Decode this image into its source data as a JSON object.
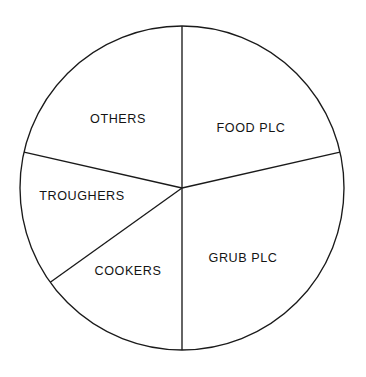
{
  "chart_data": {
    "type": "pie",
    "title": "",
    "subtitle": "",
    "xlabel": "",
    "ylabel": "",
    "legend": "none",
    "grid": false,
    "labels_inside": true,
    "geometry": {
      "center_x": 182,
      "center_y": 188,
      "radius": 162,
      "start_angle_deg": 0,
      "direction": "clockwise"
    },
    "categories": [
      "FOOD PLC",
      "GRUB PLC",
      "COOKERS",
      "TROUGHERS",
      "OTHERS"
    ],
    "values": [
      21.4,
      28.6,
      15.1,
      13.4,
      21.4
    ],
    "angles_deg": [
      77.2,
      102.8,
      54.4,
      48.4,
      77.2
    ],
    "slices": [
      {
        "name": "FOOD PLC",
        "label": "FOOD PLC",
        "value": 21.4,
        "angle_deg": 77.2,
        "start_deg": 0,
        "end_deg": 77.2,
        "label_x": 251,
        "label_y": 129
      },
      {
        "name": "GRUB PLC",
        "label": "GRUB PLC",
        "value": 28.6,
        "angle_deg": 102.8,
        "start_deg": 77.2,
        "end_deg": 180,
        "label_x": 243,
        "label_y": 259
      },
      {
        "name": "COOKERS",
        "label": "COOKERS",
        "value": 15.1,
        "angle_deg": 54.4,
        "start_deg": 180,
        "end_deg": 234.4,
        "label_x": 128,
        "label_y": 272
      },
      {
        "name": "TROUGHERS",
        "label": "TROUGHERS",
        "value": 13.4,
        "angle_deg": 48.4,
        "start_deg": 234.4,
        "end_deg": 282.8,
        "label_x": 82,
        "label_y": 197
      },
      {
        "name": "OTHERS",
        "label": "OTHERS",
        "value": 21.4,
        "angle_deg": 77.2,
        "start_deg": 282.8,
        "end_deg": 360,
        "label_x": 118,
        "label_y": 120
      }
    ],
    "colors": {
      "stroke": "#1a1a1a",
      "fill": "#ffffff",
      "background": "#ffffff",
      "label_text": "#141414"
    }
  }
}
